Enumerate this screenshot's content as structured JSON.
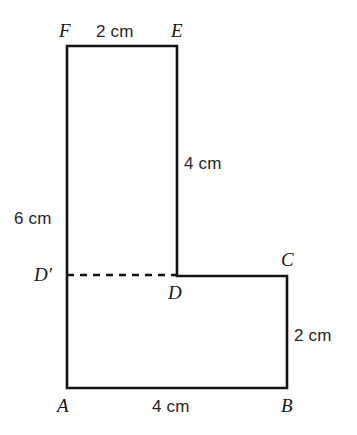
{
  "figure": {
    "stroke_color": "#111111",
    "background_color": "#ffffff",
    "stroke_width": 2.6,
    "vertices": [
      {
        "id": "F",
        "label": "F",
        "x": 67,
        "y": 46
      },
      {
        "id": "E",
        "label": "E",
        "x": 177,
        "y": 46
      },
      {
        "id": "D",
        "label": "D",
        "x": 177,
        "y": 276
      },
      {
        "id": "C",
        "label": "C",
        "x": 287,
        "y": 276
      },
      {
        "id": "B",
        "label": "B",
        "x": 287,
        "y": 388
      },
      {
        "id": "A",
        "label": "A",
        "x": 67,
        "y": 388
      },
      {
        "id": "Dp",
        "label": "D′",
        "x": 67,
        "y": 275
      }
    ],
    "outline_path": "M 67 46 L 177 46 L 177 276 L 287 276 L 287 388 L 67 388 Z",
    "dashed_segment": {
      "name": "D-prime-to-D",
      "from": "D′",
      "to": "D",
      "x1": 67,
      "y1": 275,
      "x2": 177,
      "y2": 275,
      "dash_pattern": "7 6"
    },
    "measurements": [
      {
        "id": "top",
        "text": "2 cm",
        "side": "FE",
        "value": 2,
        "unit": "cm"
      },
      {
        "id": "right4",
        "text": "4 cm",
        "side": "ED",
        "value": 4,
        "unit": "cm"
      },
      {
        "id": "left6",
        "text": "6 cm",
        "side": "FD′",
        "value": 6,
        "unit": "cm"
      },
      {
        "id": "right2",
        "text": "2 cm",
        "side": "CB",
        "value": 2,
        "unit": "cm"
      },
      {
        "id": "bottom",
        "text": "4 cm",
        "side": "AB",
        "value": 4,
        "unit": "cm"
      }
    ]
  }
}
